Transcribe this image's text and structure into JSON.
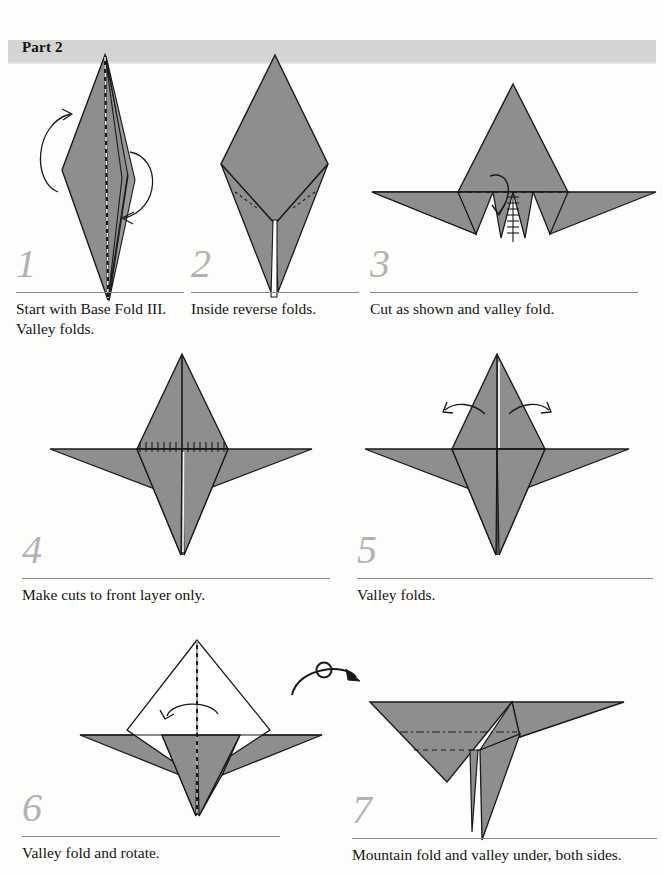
{
  "page": {
    "title": "Part 2",
    "background_color": "#fdfdfc",
    "header_bar_color": "#d4d4d4",
    "paper_fill_color": "#8e8e8e",
    "paper_white_color": "#ffffff",
    "line_color": "#1a1a1a",
    "step_number_color": "#b2b2b2",
    "rule_color": "#8a8a8a"
  },
  "steps": [
    {
      "number": "1",
      "caption": "Start with Base Fold III. Valley folds.",
      "diagram": "tall-narrow-diamond-with-center-valley-dashes-and-two-curved-arrows"
    },
    {
      "number": "2",
      "caption": "Inside reverse folds.",
      "diagram": "diamond-with-narrow-lower-spike-and-small-dashed-reverse-fold-lines"
    },
    {
      "number": "3",
      "caption": "Cut as shown and valley fold.",
      "diagram": "winged-form-with-horizontal-dashed-valley-fold-vertical-hatched-cut-and-down-arrow"
    },
    {
      "number": "4",
      "caption": "Make cuts to front layer only.",
      "diagram": "four-point-star-form-with-horizontal-hatched-cut-line"
    },
    {
      "number": "5",
      "caption": "Valley folds.",
      "diagram": "four-point-star-form-with-two-outward-curved-arrows"
    },
    {
      "number": "6",
      "caption": "Valley fold and rotate.",
      "diagram": "white-upper-diamond-over-gray-wings-with-center-dashed-line-and-left-curved-arrow"
    },
    {
      "number": "7",
      "caption": "Mountain fold and valley under, both sides.",
      "diagram": "rotated-bird-form-with-mountain-dash-dot-line-and-valley-dashed-line"
    }
  ],
  "symbols": {
    "rotate": "rotate-over-symbol",
    "valley_fold_line": "dashed-line",
    "mountain_fold_line": "dash-dot-line",
    "cut_line": "hatched-line",
    "fold_arrow": "curved-arrow"
  }
}
